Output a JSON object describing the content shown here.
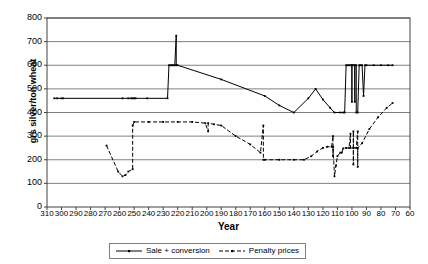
{
  "chart_data": {
    "type": "line",
    "title": "",
    "xlabel": "Year",
    "ylabel": "grs silver/ton wheat",
    "xlim": [
      310,
      60
    ],
    "ylim": [
      0,
      800
    ],
    "x_inverted": true,
    "grid": true,
    "legend_position": "bottom-center",
    "y_ticks": [
      800,
      700,
      600,
      500,
      400,
      300,
      200,
      100,
      0
    ],
    "x_ticks": [
      310,
      300,
      290,
      280,
      270,
      260,
      250,
      240,
      230,
      220,
      210,
      200,
      190,
      180,
      170,
      160,
      150,
      140,
      130,
      120,
      110,
      100,
      90,
      80,
      70,
      60
    ],
    "series": [
      {
        "name": "Sale + conversion",
        "style": "solid",
        "color": "#000000",
        "marker": "small-square",
        "points": [
          [
            305,
            460
          ],
          [
            303,
            460
          ],
          [
            300,
            460
          ],
          [
            299,
            460
          ],
          [
            258,
            460
          ],
          [
            254,
            460
          ],
          [
            252,
            460
          ],
          [
            251,
            460
          ],
          [
            250,
            460
          ],
          [
            249,
            460
          ],
          [
            241,
            460
          ],
          [
            227,
            460
          ],
          [
            226,
            600
          ],
          [
            225,
            600
          ],
          [
            224,
            600
          ],
          [
            223,
            600
          ],
          [
            222,
            600
          ],
          [
            221,
            725
          ],
          [
            221,
            600
          ],
          [
            220,
            600
          ],
          [
            190,
            540
          ],
          [
            160,
            470
          ],
          [
            150,
            430
          ],
          [
            140,
            400
          ],
          [
            130,
            460
          ],
          [
            125,
            500
          ],
          [
            120,
            455
          ],
          [
            115,
            420
          ],
          [
            112,
            400
          ],
          [
            108,
            400
          ],
          [
            106,
            400
          ],
          [
            105,
            400
          ],
          [
            104,
            600
          ],
          [
            103,
            600
          ],
          [
            102,
            600
          ],
          [
            101,
            600
          ],
          [
            100,
            600
          ],
          [
            100,
            445
          ],
          [
            100,
            600
          ],
          [
            99,
            600
          ],
          [
            98,
            600
          ],
          [
            98,
            445
          ],
          [
            98,
            600
          ],
          [
            97,
            600
          ],
          [
            97,
            400
          ],
          [
            96,
            400
          ],
          [
            95,
            600
          ],
          [
            94,
            600
          ],
          [
            93,
            600
          ],
          [
            92,
            470
          ],
          [
            91,
            600
          ],
          [
            90,
            600
          ],
          [
            85,
            600
          ],
          [
            80,
            600
          ],
          [
            75,
            600
          ],
          [
            72,
            600
          ]
        ]
      },
      {
        "name": "Penalty prices",
        "style": "dashed",
        "color": "#000000",
        "marker": "small-square",
        "points": [
          [
            269,
            260
          ],
          [
            261,
            150
          ],
          [
            258,
            130
          ],
          [
            256,
            135
          ],
          [
            254,
            150
          ],
          [
            251,
            160
          ],
          [
            251,
            345
          ],
          [
            250,
            360
          ],
          [
            240,
            360
          ],
          [
            230,
            360
          ],
          [
            220,
            360
          ],
          [
            210,
            360
          ],
          [
            201,
            355
          ],
          [
            199,
            320
          ],
          [
            199,
            355
          ],
          [
            195,
            350
          ],
          [
            190,
            345
          ],
          [
            180,
            300
          ],
          [
            170,
            265
          ],
          [
            163,
            230
          ],
          [
            161,
            345
          ],
          [
            161,
            200
          ],
          [
            160,
            200
          ],
          [
            150,
            200
          ],
          [
            140,
            200
          ],
          [
            133,
            200
          ],
          [
            128,
            215
          ],
          [
            124,
            235
          ],
          [
            120,
            250
          ],
          [
            117,
            255
          ],
          [
            114,
            255
          ],
          [
            113,
            300
          ],
          [
            113,
            215
          ],
          [
            113,
            255
          ],
          [
            112,
            130
          ],
          [
            111,
            175
          ],
          [
            110,
            215
          ],
          [
            108,
            230
          ],
          [
            107,
            230
          ],
          [
            106,
            248
          ],
          [
            104,
            250
          ],
          [
            102,
            250
          ],
          [
            101,
            310
          ],
          [
            101,
            250
          ],
          [
            99,
            250
          ],
          [
            99,
            320
          ],
          [
            99,
            180
          ],
          [
            99,
            250
          ],
          [
            97,
            250
          ],
          [
            96,
            320
          ],
          [
            96,
            170
          ],
          [
            96,
            250
          ],
          [
            93,
            270
          ],
          [
            88,
            330
          ],
          [
            82,
            380
          ],
          [
            76,
            420
          ],
          [
            72,
            440
          ]
        ]
      }
    ]
  },
  "legend": {
    "entries": [
      {
        "label": "Sale + conversion",
        "style": "solid"
      },
      {
        "label": "Penalty prices",
        "style": "dashed"
      }
    ]
  },
  "axes": {
    "x_title": "Year",
    "y_title": "grs silver/ton wheat"
  }
}
